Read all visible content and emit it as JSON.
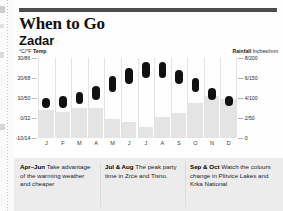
{
  "header": {
    "title": "When to Go",
    "subtitle": "Zadar"
  },
  "chart_data": {
    "type": "bar",
    "subtitle": "Zadar",
    "temp_legend_prefix": "°C/°F",
    "temp_legend_bold": "Temp",
    "rain_legend_bold": "Rainfall",
    "rain_legend_suffix": "Inches/mm",
    "categories": [
      "J",
      "F",
      "M",
      "A",
      "M",
      "J",
      "J",
      "A",
      "S",
      "O",
      "N",
      "D"
    ],
    "xlabel": "",
    "ylabel": "°C/°F Temp",
    "y2label": "Rainfall Inches/mm",
    "ylim": [
      -10,
      30
    ],
    "y2lim": [
      0,
      200
    ],
    "grid": false,
    "legend_position": "top",
    "yticks": [
      {
        "value": 30,
        "label": "30/86"
      },
      {
        "value": 20,
        "label": "20/68"
      },
      {
        "value": 10,
        "label": "10/50"
      },
      {
        "value": 0,
        "label": "0/32"
      },
      {
        "value": -10,
        "label": "-10/14"
      }
    ],
    "y2ticks": [
      {
        "value": 200,
        "label": "8/200"
      },
      {
        "value": 150,
        "label": "6/150"
      },
      {
        "value": 100,
        "label": "4/100"
      },
      {
        "value": 50,
        "label": "2/50"
      },
      {
        "value": 0,
        "label": "0"
      }
    ],
    "series": [
      {
        "name": "Temperature range (°C)",
        "type": "range-bar",
        "color": "#111111",
        "low": [
          5,
          5,
          7,
          9,
          13,
          17,
          20,
          20,
          17,
          13,
          9,
          6
        ],
        "high": [
          10,
          11,
          13,
          16,
          21,
          25,
          28,
          28,
          24,
          20,
          15,
          11
        ]
      },
      {
        "name": "Rainfall (mm)",
        "type": "bar",
        "color": "#e4e4e4",
        "values": [
          70,
          66,
          74,
          76,
          48,
          40,
          28,
          52,
          62,
          88,
          106,
          98
        ]
      }
    ]
  },
  "tips": [
    {
      "id": "apr-jun",
      "months": "Apr–Jun",
      "text": " Take advantage of the warming weather and cheaper"
    },
    {
      "id": "jul-aug",
      "months": "Jul & Aug",
      "text": " The peak party time in Zrće and Tisno."
    },
    {
      "id": "sep-oct",
      "months": "Sep & Oct",
      "text": " Watch the colours change in Plitvice Lakes and Krka National"
    }
  ]
}
